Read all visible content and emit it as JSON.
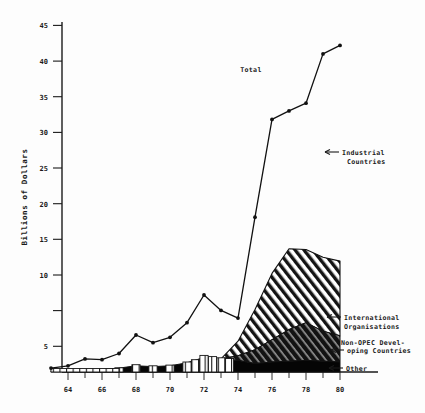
{
  "chart_data": {
    "type": "area",
    "title": "",
    "xlabel": "",
    "ylabel": "Billions of Dollars",
    "xlim": [
      63,
      80
    ],
    "ylim": [
      0,
      46
    ],
    "yticks": [
      5,
      10,
      15,
      20,
      25,
      30,
      35,
      40,
      45
    ],
    "xticks": [
      64,
      66,
      68,
      70,
      72,
      74,
      76,
      78,
      80
    ],
    "xtick_labels": [
      "64",
      "66",
      "68",
      "70",
      "72",
      "74",
      "76",
      "78",
      "80"
    ],
    "ytick_labels": [
      "5",
      "10",
      "15",
      "20",
      "25",
      "30",
      "35",
      "40",
      "45"
    ],
    "x": [
      63,
      64,
      65,
      66,
      67,
      68,
      69,
      70,
      71,
      72,
      73,
      74,
      75,
      76,
      77,
      78,
      79,
      80
    ],
    "grid": false,
    "legend_position": "right-annotations",
    "series": [
      {
        "name": "Total",
        "type": "line",
        "values": [
          0.5,
          0.8,
          1.7,
          1.6,
          2.4,
          4.8,
          3.8,
          4.5,
          6.4,
          10.0,
          8.0,
          7.0,
          20.1,
          32.8,
          33.9,
          34.9,
          41.3,
          42.4
        ]
      },
      {
        "name": "International Organisations",
        "type": "stacked-area",
        "fill": "diagonal-hatch",
        "values": [
          0,
          0,
          0,
          0,
          0,
          0,
          0,
          0,
          0,
          0,
          0,
          1.9,
          5.2,
          8.6,
          10.5,
          9.5,
          9.6,
          9.7
        ]
      },
      {
        "name": "Non-OPEC Developing Countries",
        "type": "stacked-area",
        "fill": "dark-solid",
        "values": [
          0,
          0,
          0,
          0,
          0,
          0,
          0,
          0,
          0,
          0,
          0,
          0.6,
          1.8,
          2.9,
          4.1,
          4.9,
          3.9,
          3.4
        ]
      },
      {
        "name": "Other",
        "type": "stacked-area",
        "fill": "black-solid",
        "values": [
          0.2,
          0.25,
          0.3,
          0.35,
          0.5,
          0.8,
          0.7,
          0.8,
          1.2,
          1.9,
          1.7,
          1.5,
          1.1,
          1.3,
          1.4,
          1.5,
          1.4,
          1.3
        ]
      }
    ],
    "annotations": [
      {
        "label": "Total",
        "x": 75.3,
        "y": 38.5
      },
      {
        "label": "Industrial Countries",
        "x": 79.0,
        "y": 28.5
      },
      {
        "label": "International Organisations",
        "x": 80.6,
        "y": 7.2
      },
      {
        "label": "Non-OPEC Developing Countries",
        "x": 80.6,
        "y": 3.4
      },
      {
        "label": "Other",
        "x": 80.6,
        "y": 0.6
      }
    ]
  },
  "axes": {
    "ylabel": "Billions of Dollars"
  },
  "annotations": {
    "total": "Total",
    "industrial_line1": "Industrial",
    "industrial_line2": "Countries",
    "intl_line1": "International",
    "intl_line2": "Organisations",
    "nonopec_line1": "Non-OPEC Devel-",
    "nonopec_line2": "oping Countries",
    "other": "Other"
  },
  "colors": {
    "ink": "#1a1a1a",
    "background": "#fdfdfd",
    "hatch": "#111111",
    "dark_band": "#1b1b1b",
    "black_band": "#000000"
  }
}
